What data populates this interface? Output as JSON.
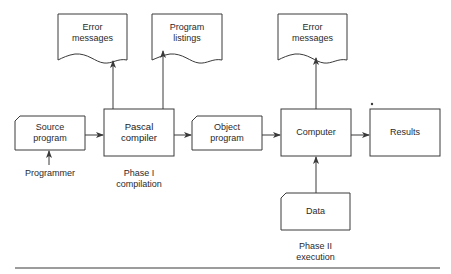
{
  "diagram": {
    "nodes": {
      "source_program": {
        "label_line1": "Source",
        "label_line2": "program",
        "shape": "card"
      },
      "pascal_compiler": {
        "label_line1": "Pascal",
        "label_line2": "compiler",
        "shape": "process"
      },
      "object_program": {
        "label_line1": "Object",
        "label_line2": "program",
        "shape": "card"
      },
      "computer": {
        "label": "Computer",
        "shape": "process"
      },
      "results": {
        "label": "Results",
        "shape": "process"
      },
      "error_messages_1": {
        "label_line1": "Error",
        "label_line2": "messages",
        "shape": "document"
      },
      "program_listings": {
        "label_line1": "Program",
        "label_line2": "listings",
        "shape": "document"
      },
      "error_messages_2": {
        "label_line1": "Error",
        "label_line2": "messages",
        "shape": "document"
      },
      "data": {
        "label": "Data",
        "shape": "card"
      }
    },
    "annotations": {
      "programmer": "Programmer",
      "phase1_line1": "Phase I",
      "phase1_line2": "compilation",
      "phase2_line1": "Phase II",
      "phase2_line2": "execution"
    },
    "edges": [
      {
        "from": "programmer",
        "to": "source_program"
      },
      {
        "from": "source_program",
        "to": "pascal_compiler"
      },
      {
        "from": "pascal_compiler",
        "to": "error_messages_1"
      },
      {
        "from": "pascal_compiler",
        "to": "program_listings"
      },
      {
        "from": "pascal_compiler",
        "to": "object_program"
      },
      {
        "from": "object_program",
        "to": "computer"
      },
      {
        "from": "computer",
        "to": "error_messages_2"
      },
      {
        "from": "computer",
        "to": "results"
      },
      {
        "from": "data",
        "to": "computer"
      }
    ],
    "colors": {
      "stroke": "#3a3a3a",
      "text": "#2a2a2a",
      "background": "#ffffff"
    }
  }
}
